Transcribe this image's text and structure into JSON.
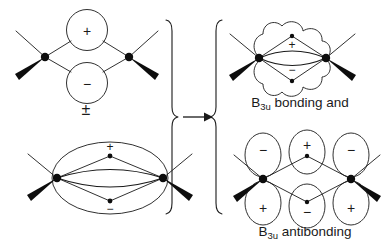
{
  "figure": {
    "name": "molecular-orbital-combination",
    "background_color": "#ffffff",
    "line_color": "#1a1a1a"
  },
  "operator": {
    "plus_minus": "±",
    "arrow": "→"
  },
  "left_group": {
    "top_diagram": {
      "name": "pi-orbital-pair",
      "lobes": [
        {
          "sign": "+",
          "position": "top"
        },
        {
          "sign": "−",
          "position": "bottom"
        }
      ]
    },
    "bottom_diagram": {
      "name": "sigma-lens-orbital",
      "lobes": [
        {
          "sign": "+",
          "position": "top"
        },
        {
          "sign": "−",
          "position": "bottom"
        }
      ]
    }
  },
  "right_group": {
    "top_diagram": {
      "name": "b3u-bonding-orbital",
      "caption_main": "B",
      "caption_sub": "3u",
      "caption_rest": " bonding and",
      "caption_full": "B3u bonding and",
      "lobes": [
        {
          "sign": "+",
          "position": "top"
        },
        {
          "sign": "−",
          "position": "bottom"
        }
      ]
    },
    "bottom_diagram": {
      "name": "b3u-antibonding-orbital",
      "caption_main": "B",
      "caption_sub": "3u",
      "caption_rest": " antibonding",
      "caption_full": "B3u antibonding",
      "lobes": [
        {
          "sign": "−",
          "position": "top-left"
        },
        {
          "sign": "+",
          "position": "top-center"
        },
        {
          "sign": "−",
          "position": "top-right"
        },
        {
          "sign": "+",
          "position": "bottom-left"
        },
        {
          "sign": "−",
          "position": "bottom-center"
        },
        {
          "sign": "+",
          "position": "bottom-right"
        }
      ]
    }
  }
}
